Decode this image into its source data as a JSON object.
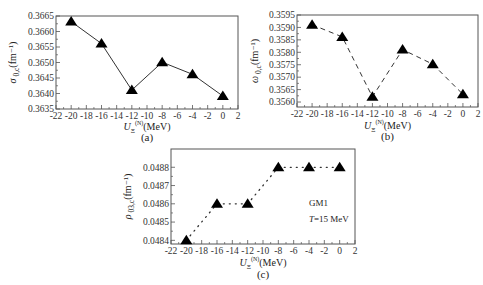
{
  "chart_data": [
    {
      "id": "a",
      "type": "line",
      "panel_label": "(a)",
      "ylabel_symbol": "σ",
      "ylabel_sub": "0,c",
      "ylabel_unit": "(fm⁻¹)",
      "xlabel_symbol": "U",
      "xlabel_sub": "Ξ",
      "xlabel_sup": "(N)",
      "xlabel_unit": "(MeV)",
      "xlim": [
        -22,
        2
      ],
      "ylim": [
        0.3635,
        0.3665
      ],
      "xticks": [
        -22,
        -20,
        -18,
        -16,
        -14,
        -12,
        -10,
        -8,
        -6,
        -4,
        -2,
        0,
        2
      ],
      "yticks": [
        "0.3635",
        "0.3640",
        "0.3645",
        "0.3650",
        "0.3655",
        "0.3660",
        "0.3665"
      ],
      "line_style": "solid",
      "marker": "triangle",
      "series": [
        {
          "name": "σ_0,c",
          "x": [
            -20,
            -16,
            -12,
            -8,
            -4,
            0
          ],
          "y": [
            0.36632,
            0.36561,
            0.36411,
            0.36501,
            0.36462,
            0.36392
          ]
        }
      ]
    },
    {
      "id": "b",
      "type": "line",
      "panel_label": "(b)",
      "ylabel_symbol": "ω",
      "ylabel_sub": "0,c",
      "ylabel_unit": "(fm⁻¹)",
      "xlabel_symbol": "U",
      "xlabel_sub": "Ξ",
      "xlabel_sup": "(N)",
      "xlabel_unit": "(MeV)",
      "xlim": [
        -22,
        2
      ],
      "ylim": [
        0.3558,
        0.3595
      ],
      "xticks": [
        -22,
        -20,
        -18,
        -16,
        -14,
        -12,
        -10,
        -8,
        -6,
        -4,
        -2,
        0,
        2
      ],
      "yticks": [
        "0.3560",
        "0.3565",
        "0.3570",
        "0.3575",
        "0.3580",
        "0.3585",
        "0.3590",
        "0.3595"
      ],
      "line_style": "dashed",
      "marker": "triangle",
      "series": [
        {
          "name": "ω_0,c",
          "x": [
            -20,
            -16,
            -12,
            -8,
            -4,
            0
          ],
          "y": [
            0.35911,
            0.35862,
            0.35621,
            0.35811,
            0.35752,
            0.35631
          ]
        }
      ]
    },
    {
      "id": "c",
      "type": "line",
      "panel_label": "(c)",
      "ylabel_symbol": "ρ",
      "ylabel_sub": "03,c",
      "ylabel_unit": "(fm⁻¹)",
      "xlabel_symbol": "U",
      "xlabel_sub": "Ξ",
      "xlabel_sup": "(N)",
      "xlabel_unit": "(MeV)",
      "xlim": [
        -22,
        2
      ],
      "ylim": [
        0.04838,
        0.0489
      ],
      "xticks": [
        -22,
        -20,
        -18,
        -16,
        -14,
        -12,
        -10,
        -8,
        -6,
        -4,
        -2,
        0,
        2
      ],
      "yticks": [
        "0.0484",
        "0.0485",
        "0.0486",
        "0.0487",
        "0.0488"
      ],
      "line_style": "dotted",
      "marker": "triangle",
      "annotations": [
        "GM1",
        "T=15 MeV"
      ],
      "series": [
        {
          "name": "ρ_03,c",
          "x": [
            -20,
            -16,
            -12,
            -8,
            -4,
            0
          ],
          "y": [
            0.0484,
            0.0486,
            0.0486,
            0.0488,
            0.0488,
            0.0488
          ]
        }
      ]
    }
  ]
}
